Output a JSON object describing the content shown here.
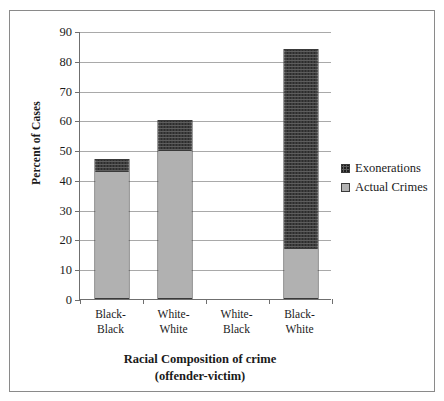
{
  "chart_data": {
    "type": "bar",
    "stacked": true,
    "title": "",
    "categories": [
      "Black-Black",
      "White-White",
      "White-Black",
      "Black-White"
    ],
    "category_lines": [
      [
        "Black-",
        "Black"
      ],
      [
        "White-",
        "White"
      ],
      [
        "White-",
        "Black"
      ],
      [
        "Black-",
        "White"
      ]
    ],
    "series": [
      {
        "name": "Actual Crimes",
        "values": [
          43,
          50,
          0,
          17
        ]
      },
      {
        "name": "Exonerations",
        "values": [
          4,
          10,
          0,
          67
        ]
      }
    ],
    "totals": [
      47,
      60,
      0,
      84
    ],
    "xlabel": "Racial Composition of crime (offender-victim)",
    "xlabel_lines": [
      "Racial Composition of crime",
      "(offender-victim)"
    ],
    "ylabel": "Percent of Cases",
    "ylim": [
      0,
      90
    ],
    "ytick_step": 10,
    "yticks": [
      90,
      80,
      70,
      60,
      50,
      40,
      30,
      20,
      10,
      0
    ],
    "grid": true,
    "legend_position": "right",
    "legend": [
      {
        "label": "Exonerations",
        "swatch": "dark-crosshatch"
      },
      {
        "label": "Actual Crimes",
        "swatch": "light-dotted"
      }
    ],
    "colors": {
      "exonerations": "#5d5d5d",
      "actual_crimes": "#e4e4e4",
      "axis": "#6f6f6f",
      "gridline": "#a9a9a9",
      "bar_outline": "#3a3a3a",
      "frame": "#8a8a8a",
      "background": "#ffffff"
    }
  }
}
